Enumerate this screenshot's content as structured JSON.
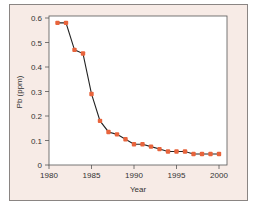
{
  "chart_data": {
    "type": "line",
    "title": "",
    "xlabel": "Year",
    "ylabel": "Pb (ppm)",
    "xlim": [
      1980,
      2002
    ],
    "ylim": [
      0,
      0.6
    ],
    "xticks": [
      1980,
      1985,
      1990,
      1995,
      2000
    ],
    "yticks": [
      0,
      0.1,
      0.2,
      0.3,
      0.4,
      0.5,
      0.6
    ],
    "grid": false,
    "legend": null,
    "series": [
      {
        "name": "Pb",
        "marker_color": "#e8643c",
        "line_color": "#222222",
        "x": [
          1981,
          1982,
          1983,
          1984,
          1985,
          1986,
          1987,
          1988,
          1989,
          1990,
          1991,
          1992,
          1993,
          1994,
          1995,
          1996,
          1997,
          1998,
          1999,
          2000
        ],
        "values": [
          0.58,
          0.58,
          0.47,
          0.455,
          0.29,
          0.18,
          0.135,
          0.125,
          0.105,
          0.085,
          0.085,
          0.075,
          0.065,
          0.055,
          0.055,
          0.055,
          0.045,
          0.045,
          0.045,
          0.045
        ]
      }
    ]
  },
  "colors": {
    "frame_bg": "#f7ebe6",
    "plot_bg": "#ffffff",
    "marker": "#e8643c"
  }
}
